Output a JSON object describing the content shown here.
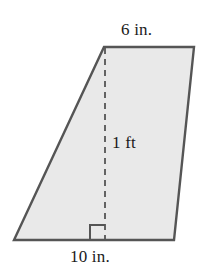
{
  "figure": {
    "kind": "trapezoid-with-altitude",
    "background_color": "#ffffff",
    "fill_color": "#e9e9e9",
    "stroke_color": "#555555",
    "dash_color": "#555555",
    "text_color": "#1a1a1a",
    "vertices": {
      "top_left": [
        104,
        47
      ],
      "top_right": [
        194,
        47
      ],
      "bottom_right": [
        174,
        240
      ],
      "bottom_left": [
        14,
        240
      ]
    },
    "altitude": {
      "from": [
        105,
        47
      ],
      "to": [
        105,
        240
      ],
      "style": "dashed"
    },
    "right_angle_marker": {
      "x": 90,
      "y": 225,
      "size": 15
    }
  },
  "labels": {
    "top_side": "6 in.",
    "height": "1 ft",
    "bottom_side": "10 in."
  }
}
